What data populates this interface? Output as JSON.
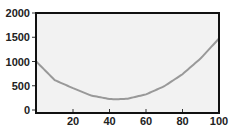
{
  "chart_data": {
    "type": "line",
    "title": "",
    "xlabel": "",
    "ylabel": "",
    "xlim": [
      0,
      100
    ],
    "ylim": [
      0,
      2000
    ],
    "grid": false,
    "legend": null,
    "x_ticks": [
      20,
      40,
      60,
      80,
      100
    ],
    "y_ticks": [
      0,
      500,
      1000,
      1500,
      2000
    ],
    "series": [
      {
        "name": "curve",
        "color": "#999999",
        "x": [
          0,
          10,
          20,
          30,
          40,
          44,
          50,
          60,
          70,
          80,
          90,
          100
        ],
        "y": [
          994,
          616,
          450,
          298,
          226,
          220,
          234,
          322,
          490,
          738,
          1066,
          1474
        ]
      }
    ]
  },
  "colors": {
    "plot_background": "#f2f2f2",
    "frame": "#111111",
    "line": "#999999"
  }
}
